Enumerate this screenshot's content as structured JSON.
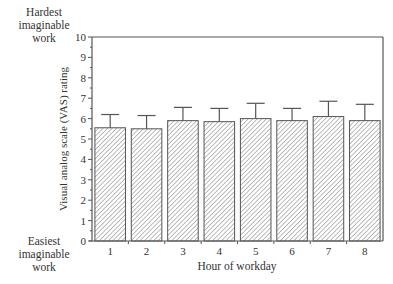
{
  "chart_data": {
    "type": "bar",
    "title": "",
    "xlabel": "Hour of workday",
    "ylabel": "Visual analog scale (VAS) rating",
    "categories": [
      "1",
      "2",
      "3",
      "4",
      "5",
      "6",
      "7",
      "8"
    ],
    "values": [
      5.55,
      5.5,
      5.9,
      5.85,
      6.0,
      5.9,
      6.1,
      5.9
    ],
    "error_upper": [
      6.2,
      6.15,
      6.55,
      6.5,
      6.75,
      6.5,
      6.85,
      6.7
    ],
    "ylim": [
      0,
      10
    ],
    "yticks": [
      0,
      1,
      2,
      3,
      4,
      5,
      6,
      7,
      8,
      9,
      10
    ],
    "minor_yticks_step": 0.5,
    "grid": false,
    "legend": null,
    "bar_fill": "diagonal-hatch",
    "annotations": {
      "top": [
        "Hardest",
        "imaginable",
        "work"
      ],
      "bottom": [
        "Easiest",
        "imaginable",
        "work"
      ]
    }
  },
  "colors": {
    "axis": "#555555",
    "bar_edge": "#555555",
    "hatch": "#777777",
    "text": "#333333"
  }
}
